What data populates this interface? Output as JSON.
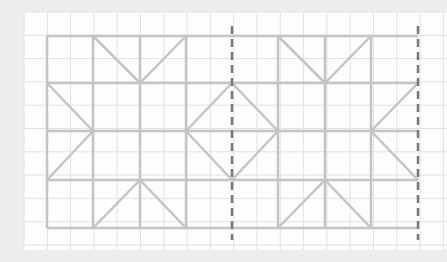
{
  "diagram": {
    "grid": {
      "cell_size": 23.3,
      "x0": 24,
      "y0": 12,
      "cols": 18,
      "rows": 10,
      "color": "#e2e2e2"
    },
    "pattern": {
      "color": "#c4c4c4",
      "stroke_width": 2.5,
      "frame": {
        "x1": 47,
        "y1": 36,
        "x2": 418,
        "y2": 228
      },
      "verticals": [
        47,
        93,
        140,
        186,
        278,
        325,
        371
      ],
      "horizontals": [
        36,
        83,
        131,
        180,
        228
      ],
      "diagonals": [
        [
          93,
          36,
          140,
          83
        ],
        [
          140,
          83,
          186,
          36
        ],
        [
          47,
          83,
          93,
          131
        ],
        [
          93,
          131,
          47,
          180
        ],
        [
          93,
          228,
          140,
          180
        ],
        [
          140,
          180,
          186,
          228
        ],
        [
          186,
          131,
          232,
          83
        ],
        [
          232,
          83,
          278,
          131
        ],
        [
          278,
          131,
          232,
          180
        ],
        [
          232,
          180,
          186,
          131
        ],
        [
          278,
          36,
          325,
          83
        ],
        [
          325,
          83,
          371,
          36
        ],
        [
          418,
          83,
          371,
          131
        ],
        [
          371,
          131,
          418,
          180
        ],
        [
          278,
          228,
          325,
          180
        ],
        [
          325,
          180,
          371,
          228
        ]
      ]
    },
    "dashed_lines": {
      "color": "#777777",
      "x": [
        232,
        418
      ],
      "y1": 26,
      "y2": 240
    }
  }
}
